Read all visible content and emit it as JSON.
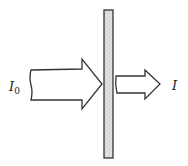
{
  "diagram": {
    "type": "beam-attenuation",
    "incident_label": {
      "symbol": "I",
      "subscript": "0"
    },
    "transmitted_label": {
      "symbol": "I"
    },
    "elements": [
      {
        "name": "incident-beam-arrow",
        "size": "large"
      },
      {
        "name": "absorbing-slab"
      },
      {
        "name": "transmitted-beam-arrow",
        "size": "small"
      }
    ],
    "colors": {
      "stroke": "#333333",
      "slab_fill": "#d8d8d8",
      "background": "#ffffff"
    }
  }
}
